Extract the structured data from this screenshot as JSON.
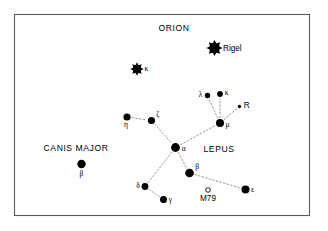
{
  "figure": {
    "background_color": "#ffffff",
    "frame_color": "#5a5a5a",
    "line_color": "#8d8d8d",
    "star_color": "#000000",
    "width": 328,
    "height": 231
  },
  "chart_data": {
    "type": "scatter",
    "title": "",
    "xlabel": "",
    "ylabel": "",
    "xlim": [
      14,
      310
    ],
    "ylim": [
      14,
      216
    ],
    "grid": false,
    "legend": null,
    "frame": {
      "x": 14.5,
      "y": 14.5,
      "width": 295,
      "height": 201
    },
    "constellation_labels": [
      {
        "id": "orion",
        "text": "ORION",
        "x": 174,
        "y": 31
      },
      {
        "id": "canis-major",
        "text": "CANIS MAJOR",
        "x": 76,
        "y": 151
      },
      {
        "id": "lepus",
        "text": "LEPUS",
        "x": 219,
        "y": 152
      }
    ],
    "stars": [
      {
        "id": "rigel",
        "name": "Rigel",
        "label": "Rigel",
        "constellation": "Orion",
        "x": 214.5,
        "y": 48.0,
        "radius": 5.2,
        "spiky": true,
        "label_dx": 8.5,
        "label_dy": 3.0,
        "label_anchor": "start",
        "label_type": "proper"
      },
      {
        "id": "kappa-orionis",
        "name": "kappa",
        "label": "κ",
        "constellation": "Orion",
        "x": 137.0,
        "y": 69.0,
        "radius": 4.3,
        "spiky": true,
        "label_dx": 7.5,
        "label_dy": 2.4,
        "label_anchor": "start",
        "label_type": "greek"
      },
      {
        "id": "lambda-lep",
        "name": "lambda",
        "label": "λ",
        "constellation": "Lepus",
        "x": 207.5,
        "y": 95.5,
        "radius": 2.7,
        "spiky": false,
        "label_dx": -5.0,
        "label_dy": 1.8,
        "label_anchor": "end",
        "label_type": "greek"
      },
      {
        "id": "kappa-lep",
        "name": "kappa",
        "label": "κ",
        "constellation": "Lepus",
        "x": 220.0,
        "y": 94.0,
        "radius": 2.9,
        "spiky": false,
        "label_dx": 4.8,
        "label_dy": 1.4,
        "label_anchor": "start",
        "label_type": "greek"
      },
      {
        "id": "r-leporis",
        "name": "R",
        "label": "R",
        "constellation": "Lepus",
        "x": 239.5,
        "y": 106.5,
        "radius": 1.7,
        "spiky": false,
        "label_dx": 4.2,
        "label_dy": 1.2,
        "label_anchor": "start",
        "label_type": "proper"
      },
      {
        "id": "mu-lep",
        "name": "mu",
        "label": "μ",
        "constellation": "Lepus",
        "x": 220.0,
        "y": 123.0,
        "radius": 4.0,
        "spiky": false,
        "label_dx": 5.5,
        "label_dy": 4.2,
        "label_anchor": "start",
        "label_type": "greek"
      },
      {
        "id": "eta-lep",
        "name": "eta",
        "label": "η",
        "constellation": "Lepus",
        "x": 127.0,
        "y": 117.0,
        "radius": 3.6,
        "spiky": false,
        "label_dx": -1.0,
        "label_dy": 10.0,
        "label_anchor": "middle",
        "label_type": "greek"
      },
      {
        "id": "zeta-lep",
        "name": "zeta",
        "label": "ζ",
        "constellation": "Lepus",
        "x": 151.5,
        "y": 120.5,
        "radius": 3.6,
        "spiky": false,
        "label_dx": 4.8,
        "label_dy": -3.6,
        "label_anchor": "start",
        "label_type": "greek"
      },
      {
        "id": "alpha-lep",
        "name": "alpha",
        "label": "α",
        "constellation": "Lepus",
        "x": 175.5,
        "y": 147.5,
        "radius": 4.4,
        "spiky": false,
        "label_dx": 6.2,
        "label_dy": 3.4,
        "label_anchor": "start",
        "label_type": "greek"
      },
      {
        "id": "beta-lep",
        "name": "beta",
        "label": "β",
        "constellation": "Lepus",
        "x": 189.5,
        "y": 173.0,
        "radius": 4.3,
        "spiky": false,
        "label_dx": 5.8,
        "label_dy": -4.0,
        "label_anchor": "start",
        "label_type": "greek"
      },
      {
        "id": "delta-lep",
        "name": "delta",
        "label": "δ",
        "constellation": "Lepus",
        "x": 145.0,
        "y": 186.5,
        "radius": 3.4,
        "spiky": false,
        "label_dx": -5.2,
        "label_dy": 1.6,
        "label_anchor": "end",
        "label_type": "greek"
      },
      {
        "id": "gamma-lep",
        "name": "gamma",
        "label": "γ",
        "constellation": "Lepus",
        "x": 163.5,
        "y": 199.5,
        "radius": 3.5,
        "spiky": false,
        "label_dx": 5.2,
        "label_dy": 2.6,
        "label_anchor": "start",
        "label_type": "greek"
      },
      {
        "id": "epsilon-lep",
        "name": "epsilon",
        "label": "ε",
        "constellation": "Lepus",
        "x": 245.5,
        "y": 189.5,
        "radius": 4.0,
        "spiky": false,
        "label_dx": 5.4,
        "label_dy": 2.6,
        "label_anchor": "start",
        "label_type": "greek"
      },
      {
        "id": "beta-cma",
        "name": "beta",
        "label": "β",
        "constellation": "Canis Major",
        "x": 81.5,
        "y": 164.0,
        "radius": 4.2,
        "spiky": false,
        "label_dx": 0.0,
        "label_dy": 12.0,
        "label_anchor": "middle",
        "label_type": "greek"
      }
    ],
    "deep_sky_objects": [
      {
        "id": "m79",
        "label": "M79",
        "object_type": "globular-cluster",
        "x": 208.0,
        "y": 190.0,
        "radius": 2.3,
        "label_dy": 11.0
      }
    ],
    "constellation_lines": [
      {
        "from": "eta-lep",
        "to": "zeta-lep"
      },
      {
        "from": "zeta-lep",
        "to": "alpha-lep"
      },
      {
        "from": "alpha-lep",
        "to": "mu-lep"
      },
      {
        "from": "alpha-lep",
        "to": "beta-lep"
      },
      {
        "from": "alpha-lep",
        "to": "delta-lep"
      },
      {
        "from": "mu-lep",
        "to": "lambda-lep"
      },
      {
        "from": "mu-lep",
        "to": "kappa-lep"
      },
      {
        "from": "mu-lep",
        "to": "r-leporis"
      },
      {
        "from": "delta-lep",
        "to": "gamma-lep"
      },
      {
        "from": "beta-lep",
        "to": "epsilon-lep"
      }
    ]
  }
}
